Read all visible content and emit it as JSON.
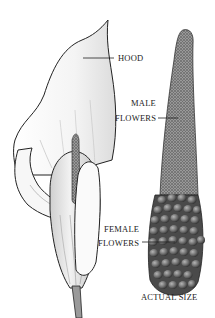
{
  "diagram": {
    "labels": {
      "hood": "HOOD",
      "male_line1": "MALE",
      "male_line2": "FLOWERS",
      "female_line1": "FEMALE",
      "female_line2": "FLOWERS",
      "scale": "ACTUAL SIZE"
    },
    "colors": {
      "ink": "#222222",
      "background": "#ffffff",
      "spadix_texture": "#6a6a6a",
      "female_bead": "#5a5a5a"
    }
  }
}
